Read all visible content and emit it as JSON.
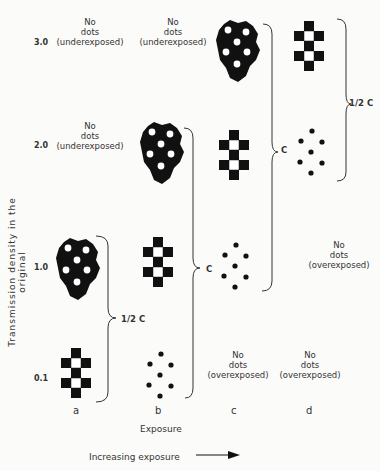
{
  "figure": {
    "y_axis_label": "Transmission density in the original",
    "x_axis_label": "Exposure",
    "arrow_label": "Increasing exposure",
    "rows": [
      "3.0",
      "2.0",
      "1.0",
      "0.1"
    ],
    "columns": [
      "a",
      "b",
      "c",
      "d"
    ],
    "cells": {
      "a_3_0": {
        "type": "text",
        "text": "No\ndots\n(underexposed)"
      },
      "a_2_0": {
        "type": "text",
        "text": "No\ndots\n(underexposed)"
      },
      "a_1_0": {
        "type": "blob-with-white-dots"
      },
      "a_0_1": {
        "type": "checkerboard"
      },
      "b_3_0": {
        "type": "text",
        "text": "No\ndots\n(underexposed)"
      },
      "b_2_0": {
        "type": "blob-with-white-dots"
      },
      "b_1_0": {
        "type": "checkerboard"
      },
      "b_0_1": {
        "type": "black-dots"
      },
      "c_3_0": {
        "type": "blob-with-white-dots"
      },
      "c_2_0": {
        "type": "checkerboard"
      },
      "c_1_0": {
        "type": "black-dots"
      },
      "c_0_1": {
        "type": "text",
        "text": "No\ndots\n(overexposed)"
      },
      "d_3_0": {
        "type": "checkerboard"
      },
      "d_2_0": {
        "type": "black-dots"
      },
      "d_1_0": {
        "type": "text",
        "text": "No\ndots\n(overexposed)"
      },
      "d_0_1": {
        "type": "text",
        "text": "No\ndots\n(overexposed)"
      }
    },
    "braces": {
      "a": "1/2 C",
      "b": "C",
      "c": "C",
      "d": "1/2 C"
    }
  }
}
